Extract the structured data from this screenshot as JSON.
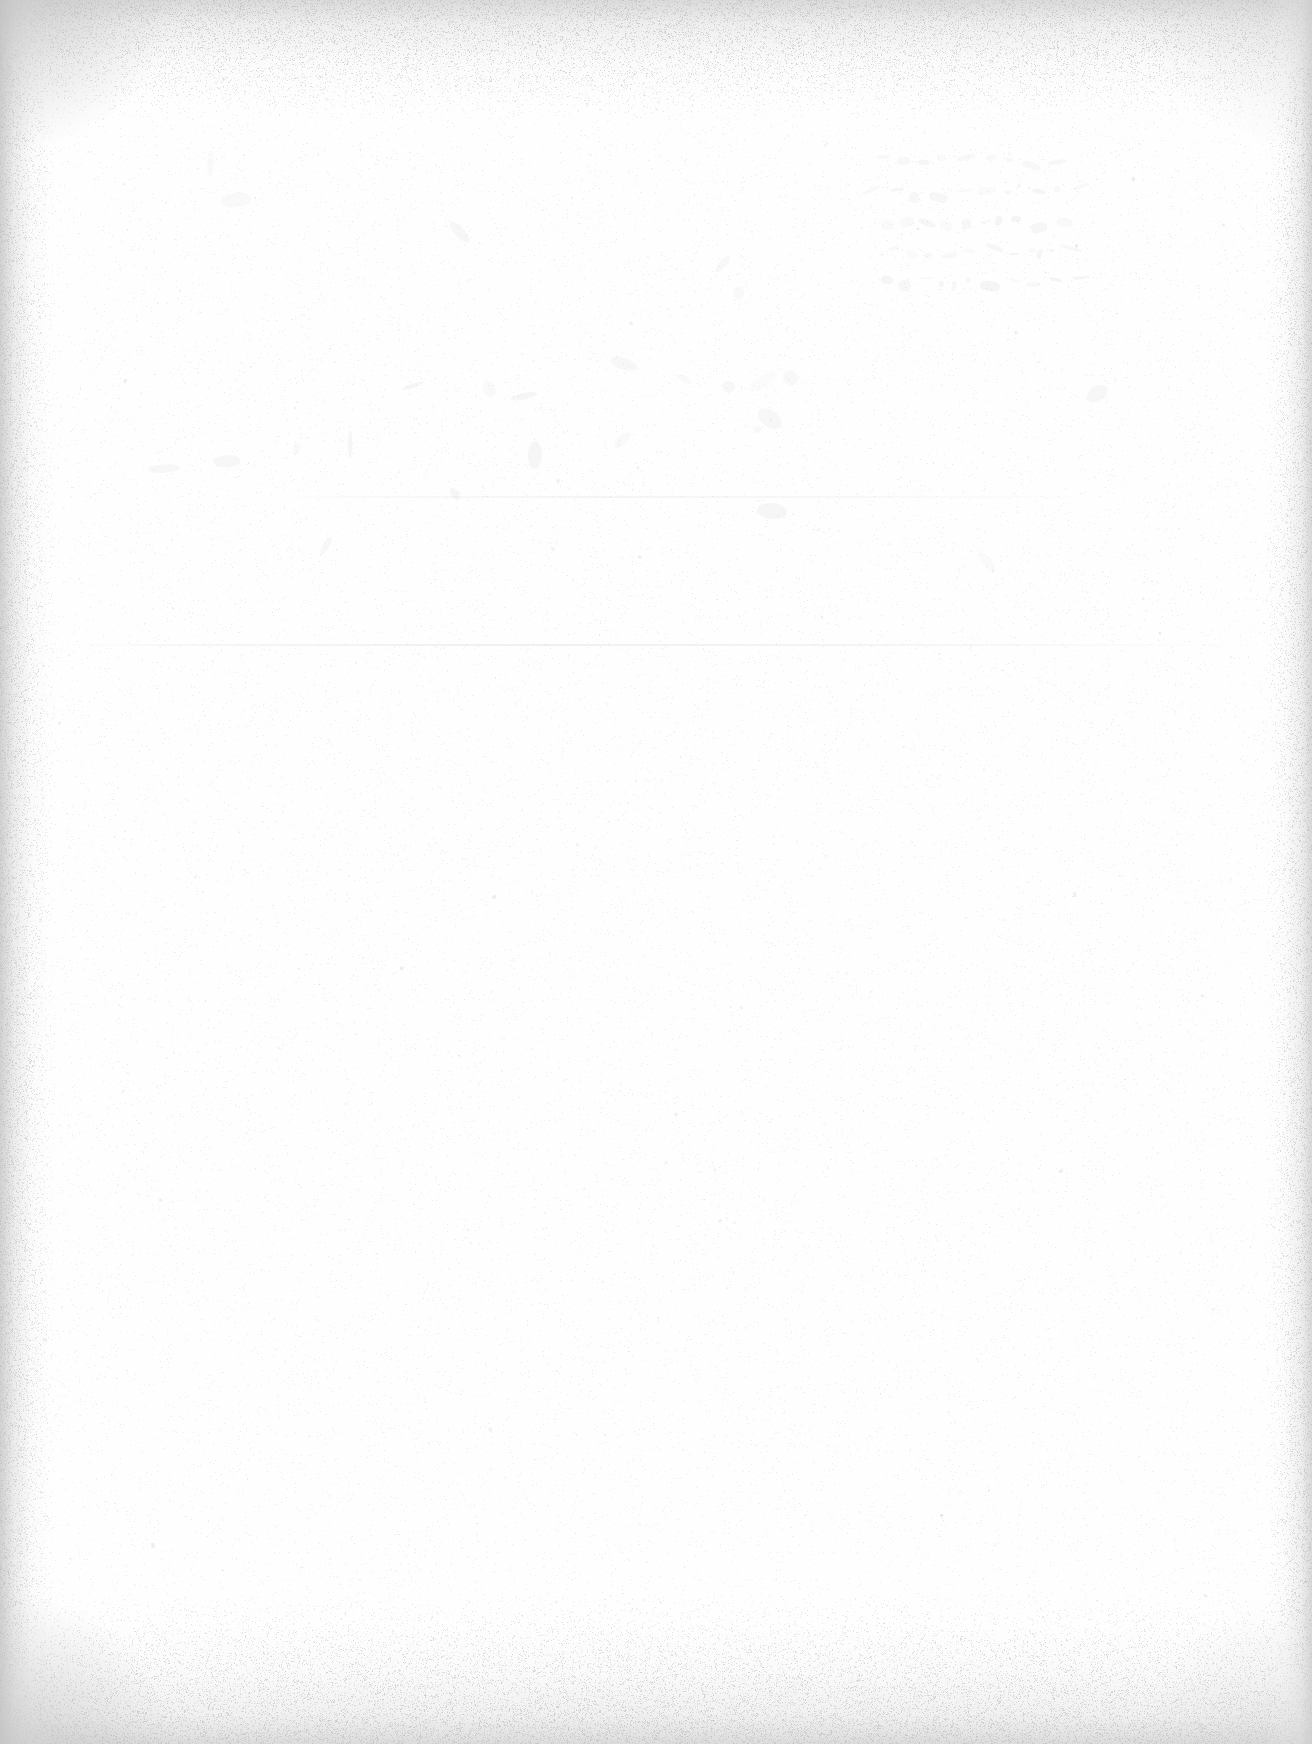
{
  "document": {
    "kind": "scanned-page",
    "title": "",
    "body_text": "",
    "visible_text": "",
    "page_number": "",
    "header": "",
    "footer": "",
    "description": "Blank scanned sheet of paper: no printed or legible handwritten text is present."
  },
  "canvas": {
    "width": 1312,
    "height": 1744
  },
  "colors": {
    "paper": "#fefefe",
    "edge_shadow": "#cdcdcd",
    "corner_shadow": "#c0c0c0",
    "grain": "#d8d8d8",
    "dust": "#cfcfcf",
    "streak": "#d8d5d9",
    "bleed_ink": "#5a5260"
  },
  "edges": {
    "top_band_height": 120,
    "bottom_band_height": 150,
    "left_band_width": 56,
    "right_band_width": 48
  },
  "artifacts": {
    "scan_streaks": [
      {
        "name": "upper-scan-streak",
        "x": 276,
        "y": 496,
        "width": 836,
        "opacity": 0.34
      },
      {
        "name": "mid-scan-streak",
        "x": 64,
        "y": 644,
        "width": 1180,
        "opacity": 0.52
      }
    ],
    "bleed_through": {
      "name": "reverse-side-handwriting",
      "x": 848,
      "y": 150,
      "width": 236,
      "height": 172,
      "legible": false,
      "note": "mirrored show-through from reverse of sheet; no characters resolvable"
    },
    "grain": {
      "density": 0.3,
      "edge_bias": true
    },
    "dust_specks": 170
  }
}
